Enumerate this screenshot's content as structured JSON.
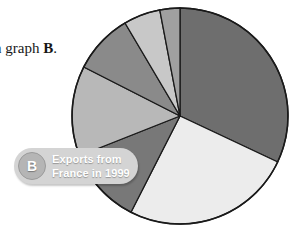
{
  "figure": {
    "caption_fragment_prefix": "n graph ",
    "caption_fragment_ref": "B",
    "caption_fragment_suffix": "."
  },
  "label_badge": {
    "badge_letter": "B",
    "title_line_1": "Exports from",
    "title_line_2": "France in 1999",
    "pill_color": "#d4d4d4",
    "circle_color": "#b5b5b5",
    "text_color": "#ffffff"
  },
  "chart_data": {
    "type": "pie",
    "title": "Exports from France in 1999",
    "subtitle": "",
    "xlabel": "",
    "ylabel": "",
    "legend_position": "none",
    "grid": false,
    "start_angle_deg": 0,
    "direction": "clockwise",
    "center_px": [
      180,
      116
    ],
    "radius_px": 108,
    "outline_color": "#1a1a1a",
    "categories": [
      "Slice 1",
      "Slice 2",
      "Slice 3",
      "Slice 4",
      "Slice 5",
      "Slice 6",
      "Slice 7"
    ],
    "values": [
      32.0,
      25.5,
      11.5,
      13.5,
      9.0,
      5.5,
      3.0
    ],
    "angles_deg": [
      115.2,
      91.8,
      41.4,
      48.6,
      32.4,
      19.8,
      10.8
    ],
    "colors": [
      "#6e6e6e",
      "#ececec",
      "#787878",
      "#b8b8b8",
      "#8a8a8a",
      "#c8c8c8",
      "#a0a0a0"
    ]
  }
}
